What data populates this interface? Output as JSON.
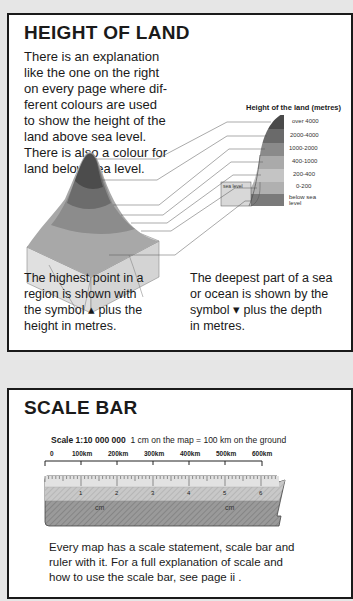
{
  "height_of_land": {
    "title": "HEIGHT OF LAND",
    "intro_lines": [
      "There is an explanation",
      "like the one on the right",
      "on every page where dif-",
      "ferent colours are used",
      "to show the height of the",
      "land above sea level.",
      "There is also a colour for",
      "land below sea level."
    ],
    "legend": {
      "title": "Height of the land (metres)",
      "sea_level_label": "sea level",
      "bands": [
        {
          "label": "over 4000",
          "color": "#4a4a4a"
        },
        {
          "label": "2000-4000",
          "color": "#6a6a6a"
        },
        {
          "label": "1000-2000",
          "color": "#8a8a8a"
        },
        {
          "label": "400-1000",
          "color": "#aaaaaa"
        },
        {
          "label": "200-400",
          "color": "#c4c4c4"
        },
        {
          "label": "0-200",
          "color": "#b0b0b0"
        },
        {
          "label": "below sea level",
          "color": "#7a7a7a"
        }
      ]
    },
    "left_column_lines": [
      "The highest point in a",
      "region is shown with",
      "the symbol ▴ plus the",
      "height in metres."
    ],
    "right_column_lines": [
      "The deepest part of a sea",
      "or ocean is shown by the",
      "symbol ▾ plus the depth",
      "in metres."
    ]
  },
  "scale_bar": {
    "title": "SCALE BAR",
    "scale_label": "Scale 1:10 000 000",
    "scale_text": "1 cm on the map = 100 km on the ground",
    "km_ticks": [
      "0",
      "100km",
      "200km",
      "300km",
      "400km",
      "500km",
      "600km"
    ],
    "cm_ticks": [
      "1",
      "2",
      "3",
      "4",
      "5",
      "6"
    ],
    "cm_label": "cm",
    "footer_lines": [
      "Every map has a scale statement, scale bar and",
      "ruler with it.  For a full explanation of scale and",
      "how to use the scale bar, see page ii ."
    ]
  }
}
